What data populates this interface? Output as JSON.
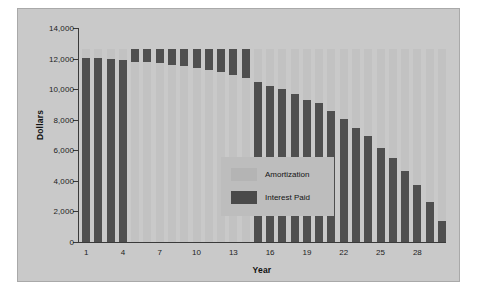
{
  "chart_data": {
    "type": "bar",
    "title": "",
    "xlabel": "Year",
    "ylabel": "Dollars",
    "ylim": [
      0,
      14000
    ],
    "ytick_values": [
      0,
      2000,
      4000,
      6000,
      8000,
      10000,
      12000,
      14000
    ],
    "ytick_labels": [
      "0",
      "2,000",
      "4,000",
      "6,000",
      "8,000",
      "10,000",
      "12,000",
      "14,000"
    ],
    "xtick_labels": [
      "1",
      "4",
      "7",
      "10",
      "13",
      "16",
      "19",
      "22",
      "25",
      "28"
    ],
    "xtick_years": [
      1,
      4,
      7,
      10,
      13,
      16,
      19,
      22,
      25,
      28
    ],
    "grid": false,
    "stacked": true,
    "legend_position": "center-left-inside",
    "categories": [
      1,
      2,
      3,
      4,
      5,
      6,
      7,
      8,
      9,
      10,
      11,
      12,
      13,
      14,
      15,
      16,
      17,
      18,
      19,
      20,
      21,
      22,
      23,
      24,
      25,
      26,
      27,
      28,
      29,
      30
    ],
    "series": [
      {
        "name": "Interest Paid",
        "color": "#4f4f4f",
        "values": [
          12050,
          12050,
          11980,
          11900,
          11800,
          11750,
          11700,
          11600,
          11500,
          11400,
          11250,
          11100,
          10950,
          10750,
          10500,
          10230,
          9980,
          9700,
          9320,
          9070,
          8540,
          8050,
          7430,
          6950,
          6180,
          5480,
          4620,
          3760,
          2620,
          1350
        ]
      },
      {
        "name": "Amortization",
        "color": "#c2c2c2",
        "values": [
          550,
          550,
          620,
          700,
          800,
          850,
          900,
          1000,
          1100,
          1200,
          1350,
          1500,
          1650,
          1850,
          2100,
          2370,
          2620,
          2900,
          3280,
          3530,
          4060,
          4550,
          5170,
          5650,
          6420,
          7120,
          7980,
          8840,
          9980,
          11250
        ]
      }
    ],
    "totals": [
      12600,
      12600,
      12600,
      12600,
      12600,
      12600,
      12600,
      12600,
      12600,
      12600,
      12600,
      12600,
      12600,
      12600,
      12600,
      12600,
      12600,
      12600,
      12600,
      12600,
      12600,
      12600,
      12600,
      12600,
      12600,
      12600,
      12600,
      12600,
      12600,
      12600
    ],
    "stack_order_by_year": [
      "interest-bottom",
      "interest-bottom",
      "interest-bottom",
      "interest-bottom",
      "amortization-bottom",
      "amortization-bottom",
      "amortization-bottom",
      "amortization-bottom",
      "amortization-bottom",
      "amortization-bottom",
      "amortization-bottom",
      "amortization-bottom",
      "amortization-bottom",
      "amortization-bottom",
      "interest-bottom",
      "interest-bottom",
      "interest-bottom",
      "interest-bottom",
      "interest-bottom",
      "interest-bottom",
      "interest-bottom",
      "interest-bottom",
      "interest-bottom",
      "interest-bottom",
      "interest-bottom",
      "interest-bottom",
      "interest-bottom",
      "interest-bottom",
      "interest-bottom",
      "interest-bottom"
    ]
  },
  "legend": {
    "items": [
      {
        "label": "Amortization",
        "color": "#b4b4b4"
      },
      {
        "label": "Interest Paid",
        "color": "#4a4a4a"
      }
    ]
  },
  "colors": {
    "page_background": "#ffffff",
    "figure_background": "#c9c9c9",
    "legend_background": "#bdbdbd",
    "axis": "#3a3a3a",
    "text": "#1d1d1d"
  }
}
